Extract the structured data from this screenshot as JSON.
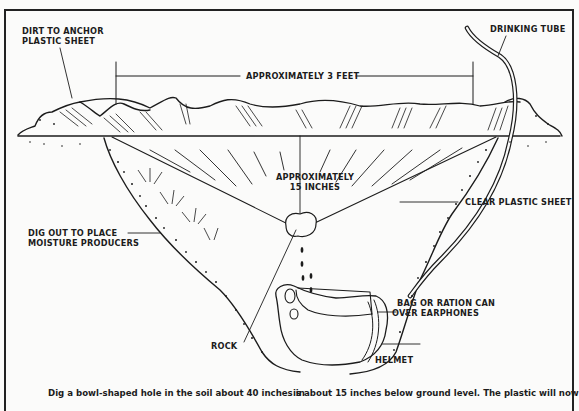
{
  "diagram": {
    "labels": {
      "dirt_anchor": [
        "DIRT TO ANCHOR",
        "PLASTIC SHEET"
      ],
      "drinking_tube": "DRINKING TUBE",
      "width_dimension": "APPROXIMATELY 3 FEET",
      "depth_dimension": [
        "APPROXIMATELY",
        "15 INCHES"
      ],
      "clear_plastic": "CLEAR PLASTIC SHEET",
      "moisture_producers": [
        "DIG OUT TO PLACE",
        "MOISTURE PRODUCERS"
      ],
      "bag_can": [
        "BAG OR RATION CAN",
        "OVER EARPHONES"
      ],
      "rock": "ROCK",
      "helmet": "HELMET"
    },
    "caption": {
      "left_column": "Dig a bowl-shaped hole in the soil about 40 inches in",
      "right_column": "is about 15 inches below ground level. The plastic will now"
    },
    "colors": {
      "ink": "#1c1c1c",
      "paper": "#fbfbfa"
    }
  }
}
